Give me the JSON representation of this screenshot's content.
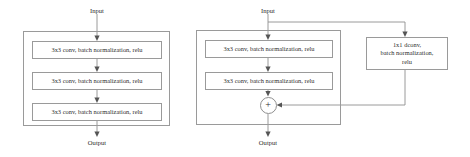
{
  "figure": {
    "type": "neural-network-block-diagram",
    "line_color": "#8f8f8f",
    "box_border_color": "#9a9a9a",
    "text_color": "#2e2e2e",
    "background": "#ffffff"
  },
  "plain_block": {
    "name": "plain-block",
    "input_label": "Input",
    "output_label": "Output",
    "layers": [
      {
        "text": "3x3 conv, batch normalization, relu"
      },
      {
        "text": "3x3 conv, batch normalization, relu"
      },
      {
        "text": "3x3 conv, batch normalization, relu"
      }
    ]
  },
  "residual_block": {
    "name": "residual-block",
    "input_label": "Input",
    "output_label": "Output",
    "layers": [
      {
        "text": "3x3 conv, batch normalization, relu"
      },
      {
        "text": "3x3 conv, batch normalization, relu"
      }
    ],
    "shortcut": {
      "text": "1x1 dconv,\nbatch normalization,\nrelu"
    },
    "merge": {
      "symbol": "+",
      "operation": "element-wise addition"
    }
  }
}
